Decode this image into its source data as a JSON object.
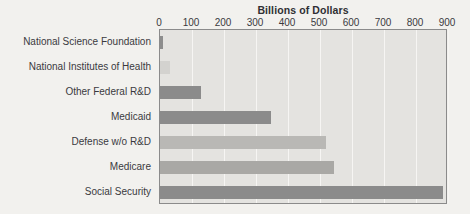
{
  "chart_data": {
    "type": "bar",
    "orientation": "horizontal",
    "title": "Billions of Dollars",
    "xlabel": "",
    "ylabel": "",
    "xlim": [
      0,
      900
    ],
    "ylim": null,
    "grid": true,
    "legend": null,
    "xticks": [
      "0",
      "100",
      "200",
      "300",
      "400",
      "500",
      "600",
      "700",
      "800",
      "900"
    ],
    "xtick_values": [
      0,
      100,
      200,
      300,
      400,
      500,
      600,
      700,
      800,
      900
    ],
    "categories": [
      "National Science Foundation",
      "National Institutes of Health",
      "Other Federal R&D",
      "Medicaid",
      "Defense w/o R&D",
      "Medicare",
      "Social Security"
    ],
    "values": [
      8,
      32,
      128,
      347,
      519,
      544,
      885
    ],
    "bar_colors": [
      "#8d8d8d",
      "#d3d2cf",
      "#8b8b8b",
      "#8b8b8b",
      "#b9b8b5",
      "#a9a8a5",
      "#8b8b8b"
    ],
    "bars": [
      {
        "label": "National Science Foundation",
        "value": 8,
        "color": "#8d8d8d"
      },
      {
        "label": "National Institutes of Health",
        "value": 32,
        "color": "#d3d2cf"
      },
      {
        "label": "Other Federal R&D",
        "value": 128,
        "color": "#8b8b8b"
      },
      {
        "label": "Medicaid",
        "value": 347,
        "color": "#8b8b8b"
      },
      {
        "label": "Defense w/o R&D",
        "value": 519,
        "color": "#b9b8b5"
      },
      {
        "label": "Medicare",
        "value": 544,
        "color": "#a9a8a5"
      },
      {
        "label": "Social Security",
        "value": 885,
        "color": "#8b8b8b"
      }
    ]
  },
  "style": {
    "figure_background": "#f2f1ee",
    "plot_background": "#e4e3e0",
    "plot_border": "#8b8b8b",
    "gridline_color": "#f6f5f3",
    "text_color": "#3a3a3e",
    "title_color": "#2f2f33"
  }
}
